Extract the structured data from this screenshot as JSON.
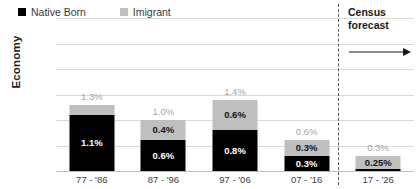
{
  "chart_data": {
    "type": "bar",
    "subtype": "stacked-bar",
    "title": "",
    "xlabel": "",
    "ylabel": "Economy",
    "ylim": [
      0,
      3.0
    ],
    "ytick_values": [
      3.0,
      2.5,
      2.0,
      1.5,
      1.0,
      0.5,
      0.0
    ],
    "ytick_labels": [
      "3.0%",
      "2.5%",
      "2.0%",
      "1.5%",
      "1.0%",
      "0.5%",
      "0.0%"
    ],
    "grid": true,
    "legend_position": "top-left-inside",
    "categories": [
      "77 - '86",
      "87 - '96",
      "97 - '06",
      "07 - '16",
      "17 - '26"
    ],
    "series": [
      {
        "name": "Native Born",
        "color": "#000000",
        "values": [
          1.1,
          0.6,
          0.8,
          0.3,
          0.04
        ],
        "labels": [
          "1.1%",
          "0.6%",
          "0.8%",
          "0.3%",
          "0.04%"
        ]
      },
      {
        "name": "Imigrant",
        "color": "#BFBFBF",
        "values": [
          0.2,
          0.4,
          0.6,
          0.3,
          0.25
        ],
        "labels": [
          "0.2%",
          "0.4%",
          "0.6%",
          "0.3%",
          "0.25%"
        ]
      }
    ],
    "totals": [
      1.3,
      1.0,
      1.4,
      0.6,
      0.3
    ],
    "total_labels": [
      "1.3%",
      "1.0%",
      "1.4%",
      "0.6%",
      "0.3%"
    ],
    "annotations": [
      {
        "name": "census-forecast",
        "line1": "Census",
        "line2": "forecast",
        "arrow_direction": "right",
        "divider_after_category_index": 3
      }
    ]
  },
  "legend": {
    "items": [
      {
        "label": "Native Born",
        "swatch": "black-square-icon"
      },
      {
        "label": "Imigrant",
        "swatch": "gray-square-icon"
      }
    ]
  },
  "axis": {
    "y_title": "Economy"
  }
}
